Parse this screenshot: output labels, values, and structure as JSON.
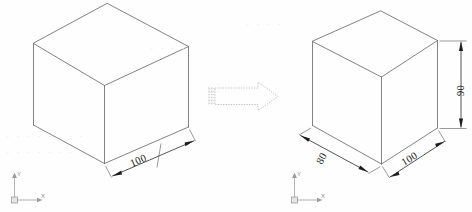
{
  "figure": {
    "background_color": "#fefefe",
    "edge_color": "#6d6d70",
    "dimension_color": "#1a1a1a",
    "transform_arrow_color": "#b9b9bd"
  },
  "left_view": {
    "name": "original-cube",
    "dimensions": [
      {
        "id": "left-100",
        "value": "100",
        "axis": "x",
        "rotation": -30
      }
    ],
    "ucs": {
      "x_label": "X",
      "y_label": "Y"
    }
  },
  "transform_arrow": {
    "label": "",
    "direction": "right",
    "style": "dashed-outline"
  },
  "right_view": {
    "name": "stretched-box",
    "dimensions": [
      {
        "id": "right-80",
        "value": "80",
        "axis": "y",
        "rotation": 30
      },
      {
        "id": "right-100",
        "value": "100",
        "axis": "x",
        "rotation": -30
      },
      {
        "id": "right-90",
        "value": "90",
        "axis": "z",
        "rotation": 90
      }
    ],
    "ucs": {
      "x_label": "X",
      "y_label": "Y"
    }
  },
  "watermarks": [
    {
      "text": "· · · · · · · ·",
      "x": 6,
      "y": 130
    },
    {
      "text": "· · · · · · ·",
      "x": 6,
      "y": 146
    },
    {
      "text": "· · · ·",
      "x": 150,
      "y": 42
    },
    {
      "text": "· · · ·",
      "x": 246,
      "y": 18
    },
    {
      "text": "· · ·",
      "x": 392,
      "y": 160
    }
  ]
}
